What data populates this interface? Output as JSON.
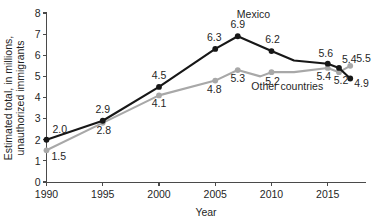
{
  "chart_data": {
    "type": "line",
    "title": "",
    "xlabel": "Year",
    "ylabel": "Estimated total, in millions, unauthorized immigrants",
    "ylabel_line1": "Estimated total, in millions,",
    "ylabel_line2": "unauthorized immigrants",
    "xlim": [
      1990,
      2017.6
    ],
    "ylim": [
      0,
      8
    ],
    "yticks": [
      0,
      1,
      2,
      3,
      4,
      5,
      6,
      7,
      8
    ],
    "ytick_labels": [
      "0",
      "1",
      "2",
      "3",
      "4",
      "5",
      "6",
      "7",
      "8"
    ],
    "xticks": [
      1990,
      1995,
      2000,
      2005,
      2010,
      2015
    ],
    "xtick_labels": [
      "1990",
      "1995",
      "2000",
      "2005",
      "2010",
      "2015"
    ],
    "grid": false,
    "legend_position": "inline-annotations",
    "series": [
      {
        "name": "Mexico",
        "color": "#171717",
        "x": [
          1990,
          1995,
          2000,
          2005,
          2007,
          2010,
          2012,
          2015,
          2016,
          2017
        ],
        "values": [
          2.0,
          2.9,
          4.5,
          6.3,
          6.9,
          6.2,
          5.75,
          5.6,
          5.4,
          4.9
        ],
        "labels": [
          {
            "x": 1990,
            "y": 2.0,
            "text": "2.0",
            "dx": 6,
            "dy": -7,
            "anchor": "start"
          },
          {
            "x": 1995,
            "y": 2.9,
            "text": "2.9",
            "dx": 0,
            "dy": -8,
            "anchor": "mid"
          },
          {
            "x": 2000,
            "y": 4.5,
            "text": "4.5",
            "dx": 0,
            "dy": -8,
            "anchor": "mid"
          },
          {
            "x": 2005,
            "y": 6.3,
            "text": "6.3",
            "dx": -1,
            "dy": -8,
            "anchor": "mid"
          },
          {
            "x": 2007,
            "y": 6.9,
            "text": "6.9",
            "dx": 0,
            "dy": -8,
            "anchor": "mid"
          },
          {
            "x": 2010,
            "y": 6.2,
            "text": "6.2",
            "dx": 1,
            "dy": -8,
            "anchor": "mid"
          },
          {
            "x": 2015,
            "y": 5.6,
            "text": "5.6",
            "dx": -2,
            "dy": -7,
            "anchor": "mid"
          },
          {
            "x": 2016,
            "y": 5.4,
            "text": "5.4",
            "dx": 3,
            "dy": -5,
            "anchor": "start"
          },
          {
            "x": 2017,
            "y": 4.9,
            "text": "4.9",
            "dx": 4,
            "dy": 9,
            "anchor": "start"
          }
        ]
      },
      {
        "name": "Other countries",
        "color": "#a8a8a8",
        "x": [
          1990,
          1995,
          2000,
          2005,
          2007,
          2009,
          2010,
          2012,
          2015,
          2016,
          2017
        ],
        "values": [
          1.5,
          2.8,
          4.1,
          4.8,
          5.3,
          5.0,
          5.2,
          5.2,
          5.4,
          5.2,
          5.5
        ],
        "labels": [
          {
            "x": 1990,
            "y": 1.5,
            "text": "1.5",
            "dx": 5,
            "dy": 10,
            "anchor": "start"
          },
          {
            "x": 1995,
            "y": 2.8,
            "text": "2.8",
            "dx": 1,
            "dy": 11,
            "anchor": "mid"
          },
          {
            "x": 2000,
            "y": 4.1,
            "text": "4.1",
            "dx": 0,
            "dy": 12,
            "anchor": "mid"
          },
          {
            "x": 2005,
            "y": 4.8,
            "text": "4.8",
            "dx": -1,
            "dy": 12,
            "anchor": "mid"
          },
          {
            "x": 2007,
            "y": 5.3,
            "text": "5.3",
            "dx": 0,
            "dy": 12,
            "anchor": "mid"
          },
          {
            "x": 2010,
            "y": 5.2,
            "text": "5.2",
            "dx": 1,
            "dy": 13,
            "anchor": "mid"
          },
          {
            "x": 2015,
            "y": 5.4,
            "text": "5.4",
            "dx": -4,
            "dy": 12,
            "anchor": "mid"
          },
          {
            "x": 2016,
            "y": 5.2,
            "text": "5.2",
            "dx": 2,
            "dy": 12,
            "anchor": "mid"
          },
          {
            "x": 2017,
            "y": 5.5,
            "text": "5.5",
            "dx": 6,
            "dy": -4,
            "anchor": "start"
          }
        ]
      }
    ],
    "annotations": [
      {
        "name": "mexico-series-label",
        "text": "Mexico",
        "x": 2008.4,
        "y": 7.75
      },
      {
        "name": "other-countries-series-label",
        "text": "Other countries",
        "x": 2011.4,
        "y": 4.35
      }
    ]
  }
}
